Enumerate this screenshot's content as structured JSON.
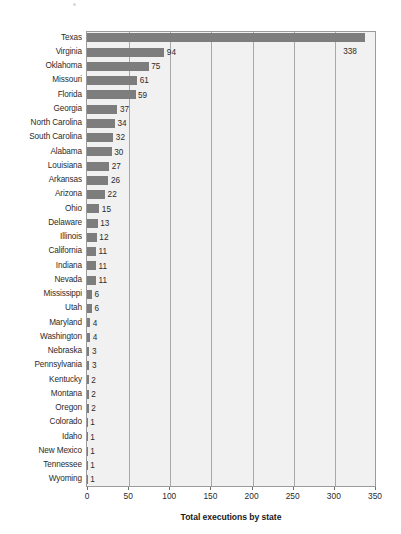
{
  "chart_data": {
    "type": "bar",
    "orientation": "horizontal",
    "title": "",
    "xlabel": "Total executions by state",
    "ylabel": "",
    "xlim": [
      0,
      350
    ],
    "xticks": [
      0,
      50,
      100,
      150,
      200,
      250,
      300,
      350
    ],
    "xtick_labels": [
      "0",
      "50",
      "100",
      "150",
      "200",
      "250",
      "300",
      "350"
    ],
    "grid": "vertical",
    "legend": "none",
    "bar_color": "#7d7d7d",
    "plot_background": "#f1f1f1",
    "categories": [
      "Texas",
      "Virginia",
      "Oklahoma",
      "Missouri",
      "Florida",
      "Georgia",
      "North Carolina",
      "South Carolina",
      "Alabama",
      "Louisiana",
      "Arkansas",
      "Arizona",
      "Ohio",
      "Delaware",
      "Illinois",
      "California",
      "Indiana",
      "Nevada",
      "Mississippi",
      "Utah",
      "Maryland",
      "Washington",
      "Nebraska",
      "Pennsylvania",
      "Kentucky",
      "Montana",
      "Oregon",
      "Colorado",
      "Idaho",
      "New Mexico",
      "Tennessee",
      "Wyoming"
    ],
    "values": [
      338,
      94,
      75,
      61,
      59,
      37,
      34,
      32,
      30,
      27,
      26,
      22,
      15,
      13,
      12,
      11,
      11,
      11,
      6,
      6,
      4,
      4,
      3,
      3,
      2,
      2,
      2,
      1,
      1,
      1,
      1,
      1
    ],
    "data_labels": [
      "338",
      "94",
      "75",
      "61",
      "59",
      "37",
      "34",
      "32",
      "30",
      "27",
      "26",
      "22",
      "15",
      "13",
      "12",
      "11",
      "11",
      "11",
      "6",
      "6",
      "4",
      "4",
      "3",
      "3",
      "2",
      "2",
      "2",
      "1",
      "1",
      "1",
      "1",
      "1"
    ]
  }
}
